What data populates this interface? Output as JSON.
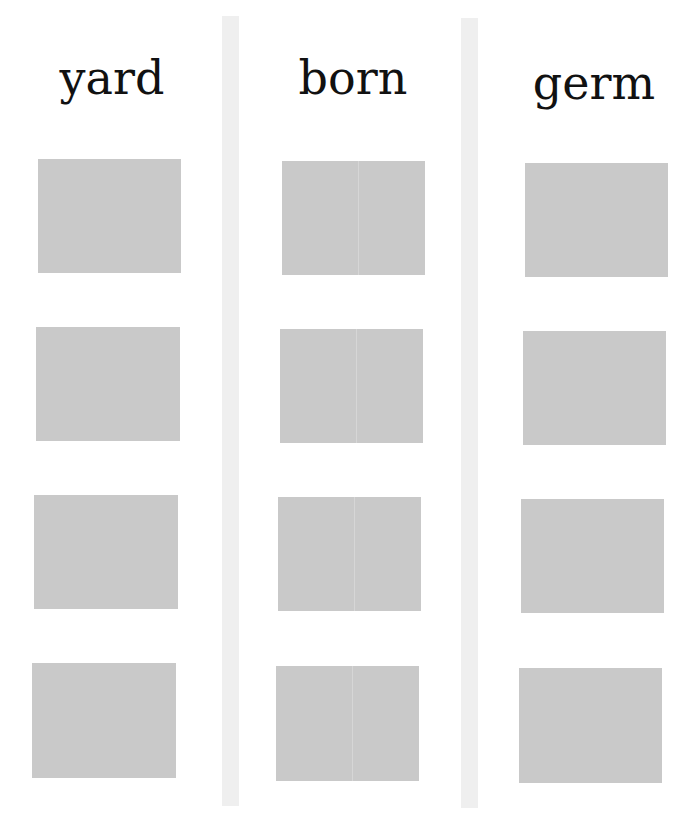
{
  "worksheet": {
    "columns": [
      {
        "heading": "yard",
        "boxes": 4
      },
      {
        "heading": "born",
        "boxes": 4
      },
      {
        "heading": "germ",
        "boxes": 4
      }
    ],
    "colors": {
      "box": "#c9c9c9",
      "divider": "#efefef",
      "text": "#111111",
      "background": "#ffffff"
    }
  }
}
